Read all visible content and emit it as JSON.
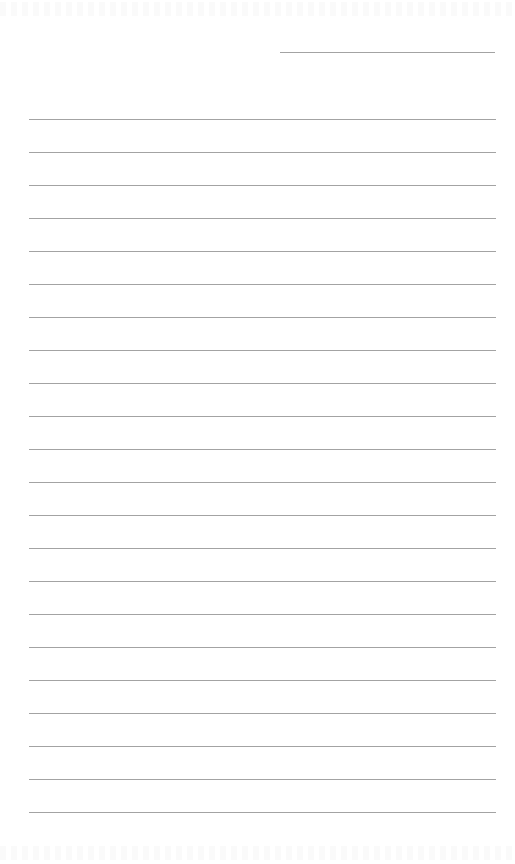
{
  "page": {
    "type": "lined notebook paper",
    "background_color": "#ffffff",
    "line_color": "#a3a3a3",
    "header_line": {
      "label": "date-line",
      "top": 52,
      "left": 280,
      "width": 215
    },
    "ruled_lines": {
      "count": 22,
      "first_top": 119,
      "spacing": 33,
      "left": 29,
      "width": 467
    }
  }
}
